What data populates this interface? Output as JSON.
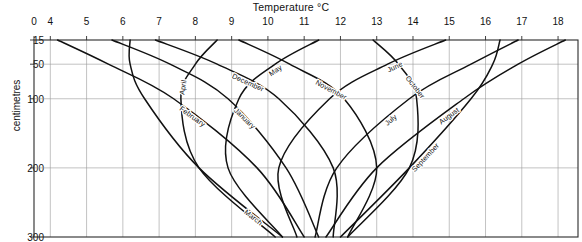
{
  "chart_data": {
    "type": "line",
    "title": "Temperature °C",
    "xlabel": "Temperature °C",
    "ylabel": "centimetres",
    "xlim": [
      3.55,
      18.55
    ],
    "ylim": [
      15,
      300
    ],
    "y_inverted": true,
    "grid": true,
    "legend": "inline-curve-labels",
    "x_ticks": [
      "0",
      "4",
      "5",
      "6",
      "7",
      "8",
      "9",
      "10",
      "11",
      "12",
      "13",
      "14",
      "15",
      "16",
      "17",
      "18"
    ],
    "y_ticks": [
      "15",
      "50",
      "100",
      "200",
      "300"
    ],
    "x_tick_values": [
      3.55,
      4,
      5,
      6,
      7,
      8,
      9,
      10,
      11,
      12,
      13,
      14,
      15,
      16,
      17,
      18
    ],
    "y_tick_values": [
      15,
      50,
      100,
      200,
      300
    ],
    "depths_cm": [
      15,
      50,
      100,
      200,
      300
    ],
    "series": [
      {
        "name": "January",
        "label": "January",
        "values": [
          5.7,
          7.3,
          8.9,
          10.5,
          11.4
        ],
        "label_t": 0.46,
        "label_dx": 1,
        "label_dy": 8
      },
      {
        "name": "February",
        "label": "February",
        "values": [
          4.2,
          5.6,
          7.4,
          9.7,
          11.0
        ],
        "label_t": 0.42,
        "label_dx": 1,
        "label_dy": 8
      },
      {
        "name": "March",
        "label": "March",
        "values": [
          6.2,
          6.2,
          6.6,
          8.1,
          10.4
        ],
        "label_t": 0.8,
        "label_dx": 2,
        "label_dy": 8
      },
      {
        "name": "April",
        "label": "April",
        "values": [
          8.6,
          8.0,
          7.6,
          8.1,
          10.2
        ],
        "label_t": 0.24,
        "label_dx": 2,
        "label_dy": 8
      },
      {
        "name": "May",
        "label": "May",
        "values": [
          11.4,
          10.2,
          9.2,
          8.9,
          10.4
        ],
        "label_t": 0.22,
        "label_dx": 2,
        "label_dy": 8
      },
      {
        "name": "June",
        "label": "June",
        "values": [
          14.9,
          13.3,
          11.7,
          10.3,
          10.8
        ],
        "label_t": 0.22,
        "label_dx": 2,
        "label_dy": 8
      },
      {
        "name": "July",
        "label": "July",
        "values": [
          16.9,
          15.6,
          13.9,
          11.9,
          11.3
        ],
        "label_t": 0.52,
        "label_dx": 2,
        "label_dy": 8
      },
      {
        "name": "August",
        "label": "August",
        "values": [
          18.2,
          16.9,
          15.4,
          13.0,
          11.6
        ],
        "label_t": 0.47,
        "label_dx": 2,
        "label_dy": 8
      },
      {
        "name": "September",
        "label": "September",
        "values": [
          16.4,
          16.2,
          15.6,
          13.9,
          12.0
        ],
        "label_t": 0.6,
        "label_dx": 2,
        "label_dy": 8
      },
      {
        "name": "October",
        "label": "October",
        "values": [
          12.9,
          13.6,
          14.1,
          13.9,
          12.2
        ],
        "label_t": 0.18,
        "label_dx": 2,
        "label_dy": 8
      },
      {
        "name": "November",
        "label": "November",
        "values": [
          9.2,
          10.6,
          12.1,
          13.0,
          12.2
        ],
        "label_t": 0.3,
        "label_dx": 2,
        "label_dy": 8
      },
      {
        "name": "December",
        "label": "December",
        "values": [
          6.9,
          8.6,
          10.3,
          11.8,
          11.8
        ],
        "label_t": 0.27,
        "label_dx": 2,
        "label_dy": 8
      }
    ]
  },
  "plot": {
    "left": 34,
    "right": 578,
    "top": 40,
    "bottom": 237
  }
}
